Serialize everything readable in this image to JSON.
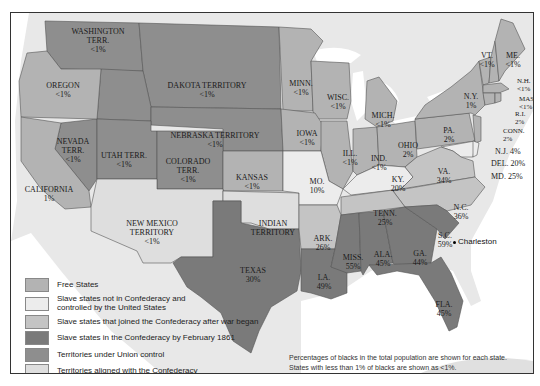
{
  "colors": {
    "free_states": "#b3b3b3",
    "slave_not_confederacy": "#ececec",
    "slave_joined_after_war": "#c4c4c4",
    "slave_confederacy_feb_1861": "#7a7a7a",
    "territories_union": "#8e8e8e",
    "territories_confederacy": "#dedede",
    "water": "#ffffff",
    "land_outside": "#e6e6e6"
  },
  "legend": {
    "items": [
      {
        "label": "Free States",
        "color": "#b3b3b3"
      },
      {
        "label": "Slave states not in Confederacy and controlled by the United States",
        "line1": "Slave states not in Confederacy and",
        "line2": "controlled by the United States",
        "color": "#ececec"
      },
      {
        "label": "Slave states that joined the Confederacy after war began",
        "color": "#c4c4c4"
      },
      {
        "label": "Slave states in the Confederacy by February 1861",
        "color": "#7a7a7a"
      },
      {
        "label": "Territories under Union control",
        "color": "#8e8e8e"
      },
      {
        "label": "Territories aligned with the Confederacy",
        "color": "#dedede"
      }
    ]
  },
  "note": {
    "line1": "Percentages of blacks in the total population are shown for each state.",
    "line2": "States with less than 1% of blacks are shown as <1%."
  },
  "city": {
    "name": "Charleston"
  },
  "regions": [
    {
      "id": "washington",
      "name": "WASHINGTON",
      "name2": "TERR.",
      "pct": "<1%",
      "category": "territories_union"
    },
    {
      "id": "oregon",
      "name": "OREGON",
      "pct": "<1%",
      "category": "free_states"
    },
    {
      "id": "dakota",
      "name": "DAKOTA TERRITORY",
      "pct": "<1%",
      "category": "territories_union"
    },
    {
      "id": "nebraska",
      "name": "NEBRASKA TERRITORY",
      "pct": "<1%",
      "category": "territories_union"
    },
    {
      "id": "nevada",
      "name": "NEVADA",
      "name2": "TERR.",
      "pct": "<1%",
      "category": "territories_union"
    },
    {
      "id": "utah",
      "name": "UTAH TERR.",
      "pct": "<1%",
      "category": "territories_union"
    },
    {
      "id": "colorado",
      "name": "COLORADO",
      "name2": "TERR.",
      "pct": "<1%",
      "category": "territories_union"
    },
    {
      "id": "california",
      "name": "CALIFORNIA",
      "pct": "1%",
      "category": "free_states"
    },
    {
      "id": "kansas",
      "name": "KANSAS",
      "pct": "<1%",
      "category": "free_states"
    },
    {
      "id": "new_mexico",
      "name": "NEW MEXICO",
      "name2": "TERRITORY",
      "pct": "<1%",
      "category": "territories_confederacy"
    },
    {
      "id": "indian",
      "name": "INDIAN",
      "name2": "TERRITORY",
      "pct": "",
      "category": "territories_confederacy"
    },
    {
      "id": "texas",
      "name": "TEXAS",
      "pct": "30%",
      "category": "slave_confederacy_feb_1861"
    },
    {
      "id": "minnesota",
      "name": "MINN.",
      "pct": "<1%",
      "category": "free_states"
    },
    {
      "id": "wisconsin",
      "name": "WISC.",
      "pct": "<1%",
      "category": "free_states"
    },
    {
      "id": "iowa",
      "name": "IOWA",
      "pct": "<1%",
      "category": "free_states"
    },
    {
      "id": "michigan",
      "name": "MICH.",
      "pct": "<1%",
      "category": "free_states"
    },
    {
      "id": "illinois",
      "name": "ILL.",
      "pct": "<1%",
      "category": "free_states"
    },
    {
      "id": "indiana",
      "name": "IND.",
      "pct": "<1%",
      "category": "free_states"
    },
    {
      "id": "ohio",
      "name": "OHIO",
      "pct": "2%",
      "category": "free_states"
    },
    {
      "id": "missouri",
      "name": "MO.",
      "pct": "10%",
      "category": "slave_not_confederacy"
    },
    {
      "id": "kentucky",
      "name": "KY.",
      "pct": "20%",
      "category": "slave_not_confederacy"
    },
    {
      "id": "arkansas",
      "name": "ARK.",
      "pct": "26%",
      "category": "slave_joined_after_war"
    },
    {
      "id": "tennessee",
      "name": "TENN.",
      "pct": "25%",
      "category": "slave_joined_after_war"
    },
    {
      "id": "virginia",
      "name": "VA.",
      "pct": "34%",
      "category": "slave_joined_after_war"
    },
    {
      "id": "north_carolina",
      "name": "N.C.",
      "pct": "36%",
      "category": "slave_joined_after_war"
    },
    {
      "id": "south_carolina",
      "name": "S.C.",
      "pct": "59%",
      "category": "slave_confederacy_feb_1861"
    },
    {
      "id": "georgia",
      "name": "GA.",
      "pct": "44%",
      "category": "slave_confederacy_feb_1861"
    },
    {
      "id": "alabama",
      "name": "ALA.",
      "pct": "45%",
      "category": "slave_confederacy_feb_1861"
    },
    {
      "id": "mississippi",
      "name": "MISS.",
      "pct": "55%",
      "category": "slave_confederacy_feb_1861"
    },
    {
      "id": "louisiana",
      "name": "LA.",
      "pct": "49%",
      "category": "slave_confederacy_feb_1861"
    },
    {
      "id": "florida",
      "name": "FLA.",
      "pct": "45%",
      "category": "slave_confederacy_feb_1861"
    },
    {
      "id": "pennsylvania",
      "name": "PA.",
      "pct": "2%",
      "category": "free_states"
    },
    {
      "id": "new_york",
      "name": "N.Y.",
      "pct": "1%",
      "category": "free_states"
    },
    {
      "id": "vermont",
      "name": "VT.",
      "pct": "<1%",
      "category": "free_states"
    },
    {
      "id": "maine",
      "name": "ME.",
      "pct": "<1%",
      "category": "free_states"
    },
    {
      "id": "new_hampshire",
      "name": "N.H.",
      "pct": "<1%",
      "category": "free_states"
    },
    {
      "id": "massachusetts",
      "name": "MASS.",
      "pct": "<1%",
      "category": "free_states"
    },
    {
      "id": "rhode_island",
      "name": "R.I.",
      "pct": "2%",
      "category": "free_states"
    },
    {
      "id": "connecticut",
      "name": "CONN.",
      "pct": "2%",
      "category": "free_states"
    },
    {
      "id": "new_jersey",
      "name": "N.J.",
      "pct": "4%",
      "label": "N.J. 4%",
      "category": "free_states"
    },
    {
      "id": "delaware",
      "name": "DEL.",
      "pct": "20%",
      "label": "DEL. 20%",
      "category": "slave_not_confederacy"
    },
    {
      "id": "maryland",
      "name": "MD.",
      "pct": "25%",
      "label": "MD. 25%",
      "category": "slave_not_confederacy"
    }
  ]
}
